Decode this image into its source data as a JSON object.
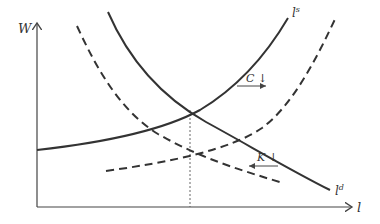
{
  "diagram": {
    "axes": {
      "y_label": "W",
      "x_label": "l"
    },
    "curves": {
      "supply": {
        "label_base": "l",
        "label_sup": "s",
        "style": "solid"
      },
      "demand": {
        "label_base": "l",
        "label_sup": "d",
        "style": "solid"
      },
      "supply_shifted": {
        "style": "dashed",
        "direction": "right"
      },
      "demand_shifted": {
        "style": "dashed",
        "direction": "left"
      }
    },
    "annotations": {
      "consumption_shift": {
        "text": "C ↓",
        "arrow": "right"
      },
      "capital_shift": {
        "text": "K ↓",
        "arrow": "left"
      }
    },
    "equilibrium_guide": {
      "style": "dotted",
      "orientation": "vertical"
    },
    "colors": {
      "line": "#333333",
      "axis": "#444444",
      "background": "#ffffff"
    }
  }
}
